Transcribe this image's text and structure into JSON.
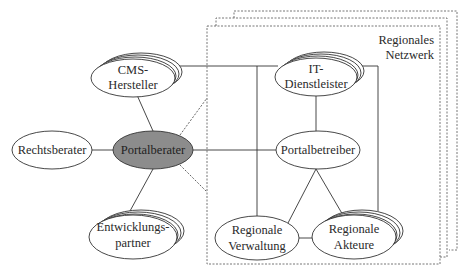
{
  "diagram": {
    "type": "network-diagram",
    "network_box": {
      "label_line1": "Regionales",
      "label_line2": "Netzwerk",
      "stack_count": 3
    },
    "nodes": [
      {
        "id": "cms",
        "line1": "CMS-",
        "line2": "Hersteller",
        "stacked": true,
        "filled": false
      },
      {
        "id": "it",
        "line1": "IT-",
        "line2": "Dienstleister",
        "stacked": true,
        "filled": false
      },
      {
        "id": "rechts",
        "line1": "Rechtsberater",
        "stacked": false,
        "filled": false
      },
      {
        "id": "portalberater",
        "line1": "Portalberater",
        "stacked": false,
        "filled": true,
        "fill_color": "#8c8c8c"
      },
      {
        "id": "portalbetreiber",
        "line1": "Portalbetreiber",
        "stacked": false,
        "filled": false
      },
      {
        "id": "entw",
        "line1": "Entwicklungs-",
        "line2": "partner",
        "stacked": true,
        "filled": false
      },
      {
        "id": "verw",
        "line1": "Regionale",
        "line2": "Verwaltung",
        "stacked": false,
        "filled": false
      },
      {
        "id": "akteure",
        "line1": "Regionale",
        "line2": "Akteure",
        "stacked": true,
        "filled": false
      }
    ],
    "edges": [
      [
        "cms",
        "portalberater"
      ],
      [
        "cms",
        "it"
      ],
      [
        "rechts",
        "portalberater"
      ],
      [
        "portalberater",
        "portalbetreiber"
      ],
      [
        "portalberater",
        "entw"
      ],
      [
        "it",
        "portalbetreiber"
      ],
      [
        "it",
        "verw"
      ],
      [
        "it",
        "akteure"
      ],
      [
        "portalbetreiber",
        "verw"
      ],
      [
        "portalbetreiber",
        "akteure"
      ],
      [
        "verw",
        "akteure"
      ]
    ],
    "dotted_edges": [
      [
        "portalberater",
        "network_box_top"
      ],
      [
        "portalberater",
        "network_box_bottom"
      ]
    ]
  }
}
